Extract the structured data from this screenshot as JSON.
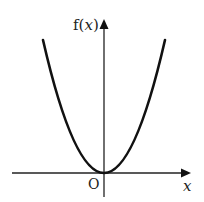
{
  "diagram": {
    "type": "function-graph",
    "function": "f(x) = x^2 (parabola, vertex at origin)",
    "labels": {
      "y_axis": "f(x)",
      "x_axis": "x",
      "origin": "O"
    },
    "colors": {
      "curve": "#111111",
      "axes": "#222222",
      "background": "#ffffff"
    }
  }
}
